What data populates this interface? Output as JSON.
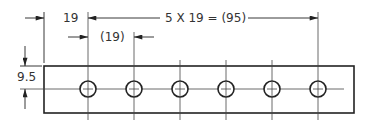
{
  "drawing": {
    "type": "engineering-dimension-drawing",
    "subject": "plate with six equally spaced holes",
    "hole_count": 6,
    "colors": {
      "line": "#222222",
      "text": "#333333",
      "background": "#ffffff"
    }
  },
  "dimensions": {
    "first_hole_offset": {
      "label": "19",
      "value": 19
    },
    "hole_spacing_chain": {
      "label": "5 X 19 = (95)",
      "count": 5,
      "pitch": 19,
      "total": 95
    },
    "reference_spacing": {
      "label": "(19)",
      "value": 19,
      "reference": true
    },
    "edge_to_centerline": {
      "label": "9.5",
      "value": 9.5
    }
  }
}
